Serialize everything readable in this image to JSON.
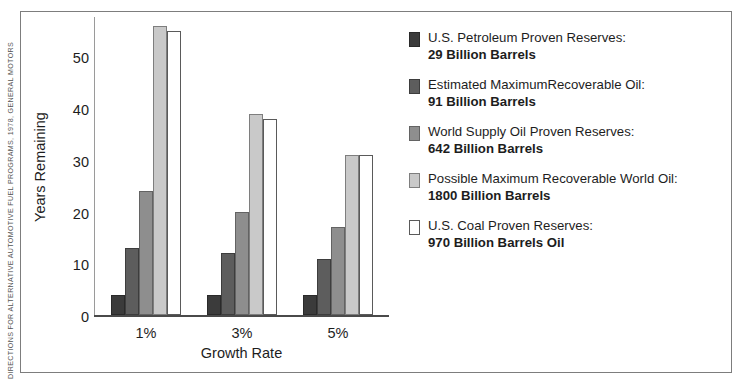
{
  "attribution": {
    "text": "DIRECTIONS FOR ALTERNATIVE AUTOMOTIVE FUEL PROGRAMS, 1978, GENERAL MOTORS"
  },
  "chart_data": {
    "type": "bar",
    "title": "",
    "xlabel": "Growth Rate",
    "ylabel": "Years Remaining",
    "categories": [
      "1%",
      "3%",
      "5%"
    ],
    "ylim": [
      0,
      58
    ],
    "yticks": [
      0,
      10,
      20,
      30,
      40,
      50
    ],
    "grid": false,
    "legend_position": "right",
    "series": [
      {
        "name": "U.S. Petroleum Proven Reserves:",
        "detail": "29 Billion Barrels",
        "color": "#3b3b3b",
        "border": "#2a2a2a",
        "values": [
          4,
          4,
          4
        ]
      },
      {
        "name": "Estimated MaximumRecoverable Oil:",
        "detail": "91 Billion Barrels",
        "color": "#5d5d5d",
        "border": "#3d3d3d",
        "values": [
          13,
          12,
          11
        ]
      },
      {
        "name": "World Supply Oil Proven Reserves:",
        "detail": "642 Billion Barrels",
        "color": "#8e8e8e",
        "border": "#636363",
        "values": [
          24,
          20,
          17
        ]
      },
      {
        "name": "Possible Maximum Recoverable World Oil:",
        "detail": "1800 Billion Barrels",
        "color": "#c9c9c9",
        "border": "#7e7e7e",
        "values": [
          56,
          39,
          31
        ]
      },
      {
        "name": "U.S. Coal Proven Reserves:",
        "detail": "970 Billion Barrels Oil",
        "color": "#ffffff",
        "border": "#5a5a5a",
        "values": [
          55,
          38,
          31
        ]
      }
    ]
  }
}
